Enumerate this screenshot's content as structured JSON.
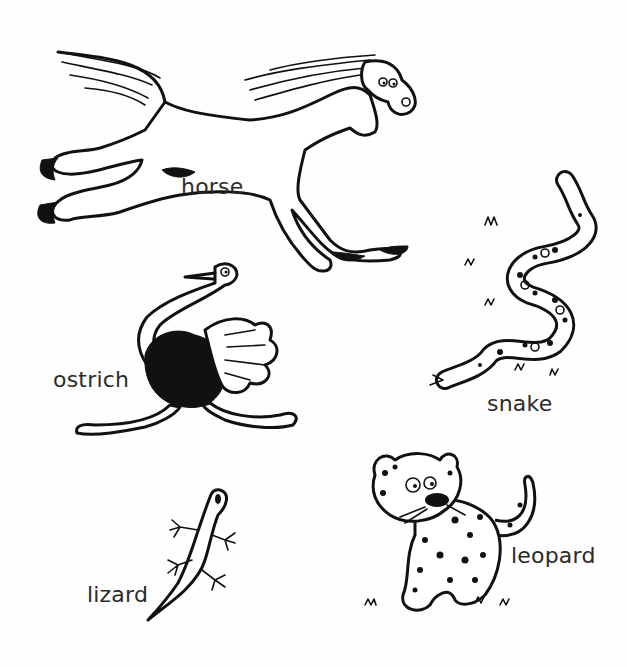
{
  "page": {
    "background": "#ffffff",
    "ink_color": "#111111",
    "label_color": "#2b2b2b"
  },
  "animals": [
    {
      "id": "horse",
      "label": "horse",
      "label_pos": {
        "x": 181,
        "y": 176
      }
    },
    {
      "id": "ostrich",
      "label": "ostrich",
      "label_pos": {
        "x": 53,
        "y": 369
      }
    },
    {
      "id": "snake",
      "label": "snake",
      "label_pos": {
        "x": 487,
        "y": 393
      }
    },
    {
      "id": "leopard",
      "label": "leopard",
      "label_pos": {
        "x": 511,
        "y": 545
      }
    },
    {
      "id": "lizard",
      "label": "lizard",
      "label_pos": {
        "x": 87,
        "y": 584
      }
    }
  ]
}
